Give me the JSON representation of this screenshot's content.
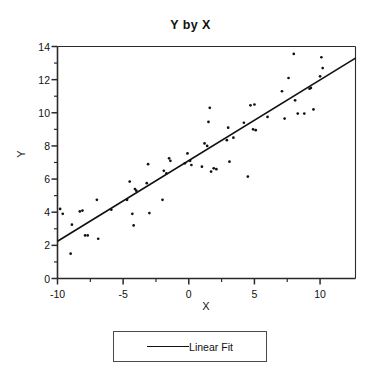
{
  "chart_data": {
    "type": "scatter",
    "title": "Y by X",
    "xlabel": "X",
    "ylabel": "Y",
    "xlim": [
      -10,
      12.7
    ],
    "ylim": [
      0,
      14
    ],
    "grid": false,
    "x_ticks": [
      -10,
      -5,
      0,
      5,
      10
    ],
    "x_tick_labels": [
      "-10",
      "-5",
      "0",
      "5",
      "10"
    ],
    "x_minor_ticks": [
      -7.5,
      -2.5,
      2.5,
      7.5
    ],
    "y_ticks": [
      0,
      2,
      4,
      6,
      8,
      10,
      12,
      14
    ],
    "y_tick_labels": [
      "0",
      "2",
      "4",
      "6",
      "8",
      "10",
      "12",
      "14"
    ],
    "legend_position": "below-center",
    "series": [
      {
        "name": "Observations",
        "type": "scatter",
        "marker": "dot",
        "color": "#111111",
        "points": [
          [
            -9.8,
            4.2
          ],
          [
            -9.6,
            3.9
          ],
          [
            -9.0,
            1.5
          ],
          [
            -8.9,
            3.25
          ],
          [
            -8.3,
            4.05
          ],
          [
            -8.1,
            4.1
          ],
          [
            -7.9,
            2.6
          ],
          [
            -7.7,
            2.6
          ],
          [
            -7.0,
            4.75
          ],
          [
            -6.9,
            2.4
          ],
          [
            -5.9,
            4.15
          ],
          [
            -4.7,
            4.75
          ],
          [
            -4.5,
            5.85
          ],
          [
            -4.3,
            3.9
          ],
          [
            -4.2,
            3.2
          ],
          [
            -4.1,
            5.4
          ],
          [
            -4.0,
            5.3
          ],
          [
            -3.2,
            5.75
          ],
          [
            -3.1,
            6.9
          ],
          [
            -3.0,
            3.95
          ],
          [
            -2.0,
            4.75
          ],
          [
            -1.9,
            6.5
          ],
          [
            -1.7,
            6.35
          ],
          [
            -1.5,
            7.25
          ],
          [
            -1.4,
            7.1
          ],
          [
            -0.3,
            6.95
          ],
          [
            -0.1,
            7.55
          ],
          [
            0.1,
            7.1
          ],
          [
            0.2,
            6.85
          ],
          [
            1.0,
            6.75
          ],
          [
            1.2,
            8.15
          ],
          [
            1.4,
            8.0
          ],
          [
            1.5,
            9.45
          ],
          [
            1.6,
            10.3
          ],
          [
            1.7,
            6.45
          ],
          [
            1.9,
            6.65
          ],
          [
            2.1,
            6.6
          ],
          [
            2.9,
            8.35
          ],
          [
            3.0,
            9.1
          ],
          [
            3.1,
            7.05
          ],
          [
            3.4,
            8.5
          ],
          [
            4.2,
            9.4
          ],
          [
            4.5,
            6.15
          ],
          [
            4.7,
            10.45
          ],
          [
            4.9,
            9.0
          ],
          [
            5.0,
            10.5
          ],
          [
            5.1,
            8.95
          ],
          [
            6.0,
            9.75
          ],
          [
            7.1,
            11.3
          ],
          [
            7.3,
            9.65
          ],
          [
            7.6,
            12.1
          ],
          [
            8.0,
            13.55
          ],
          [
            8.1,
            10.75
          ],
          [
            8.3,
            9.95
          ],
          [
            8.8,
            9.95
          ],
          [
            9.2,
            11.45
          ],
          [
            9.3,
            11.5
          ],
          [
            9.5,
            10.2
          ],
          [
            10.0,
            12.2
          ],
          [
            10.1,
            13.35
          ],
          [
            10.2,
            12.7
          ]
        ]
      }
    ],
    "fit": {
      "name": "Linear Fit",
      "type": "line",
      "color": "#111111",
      "slope": 0.4868,
      "intercept": 7.118,
      "x_start": -10,
      "y_start": 2.25,
      "x_end": 12.7,
      "y_end": 13.3
    }
  },
  "legend": {
    "items": [
      {
        "label": "Linear Fit",
        "marker": "line",
        "color": "#111111"
      }
    ]
  },
  "axes": {
    "title": "Y by X",
    "x_title": "X",
    "y_title": "Y"
  }
}
